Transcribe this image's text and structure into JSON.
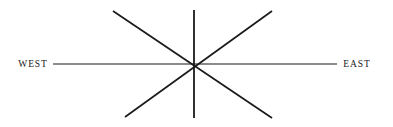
{
  "figure": {
    "background_color": "#ffffff",
    "line_color": "#1a1a1a",
    "width": 393,
    "height": 127
  },
  "labels": {
    "west": "WEST",
    "east": "EAST"
  },
  "chart_data": {
    "type": "line",
    "xlabel": "",
    "ylabel": "",
    "grid": false,
    "legend": null,
    "center": {
      "x": 194,
      "y": 64
    },
    "rays": [
      {
        "name": "west-east-axis",
        "direction": "horizontal",
        "x1": 53,
        "y1": 64,
        "x2": 337,
        "y2": 64,
        "stroke_width": 1.1,
        "labels": {
          "start": "WEST",
          "end": "EAST"
        }
      },
      {
        "name": "north-south-axis",
        "direction": "vertical",
        "x1": 194,
        "y1": 10,
        "x2": 194,
        "y2": 118,
        "stroke_width": 1.8,
        "labels": {
          "start": "",
          "end": ""
        }
      },
      {
        "name": "northwest-southeast-axis",
        "direction": "diagonal-nw-se",
        "x1": 113,
        "y1": 11,
        "x2": 272,
        "y2": 118,
        "stroke_width": 1.7,
        "labels": {
          "start": "",
          "end": ""
        }
      },
      {
        "name": "northeast-southwest-axis",
        "direction": "diagonal-ne-sw",
        "x1": 272,
        "y1": 11,
        "x2": 125,
        "y2": 117,
        "stroke_width": 1.7,
        "labels": {
          "start": "",
          "end": ""
        }
      }
    ],
    "annotations": [
      {
        "text": "WEST",
        "x": 33,
        "y": 64,
        "anchor": "middle"
      },
      {
        "text": "EAST",
        "x": 357,
        "y": 64,
        "anchor": "middle"
      }
    ]
  }
}
